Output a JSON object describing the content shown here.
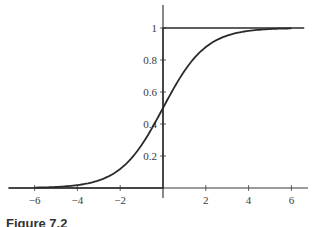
{
  "chart_data": {
    "type": "line",
    "title": "",
    "caption": "Figure 7.2",
    "xlabel": "",
    "ylabel": "",
    "xlim": [
      -7.2,
      6.8
    ],
    "ylim": [
      0,
      1.15
    ],
    "grid": false,
    "legend": null,
    "x_ticks": [
      -6,
      -4,
      -2,
      2,
      4,
      6
    ],
    "x_tick_labels": [
      "−6",
      "−4",
      "−2",
      "2",
      "4",
      "6"
    ],
    "y_ticks": [
      0.2,
      0.4,
      0.6,
      0.8,
      1
    ],
    "y_tick_labels": [
      "0.2",
      "0.4",
      "0.6",
      "0.8",
      "1"
    ],
    "series": [
      {
        "name": "logistic sigmoid",
        "style": "curve",
        "formula": "1/(1+exp(-x))",
        "x": [
          -6,
          -5,
          -4,
          -3,
          -2,
          -1,
          0,
          1,
          2,
          3,
          4,
          5,
          6
        ],
        "y": [
          0.002,
          0.007,
          0.018,
          0.047,
          0.119,
          0.269,
          0.5,
          0.731,
          0.881,
          0.953,
          0.982,
          0.993,
          0.998
        ]
      },
      {
        "name": "unit step",
        "style": "step",
        "x": [
          -7.2,
          0,
          0,
          6.6
        ],
        "y": [
          0,
          0,
          1,
          1
        ]
      }
    ]
  },
  "colors": {
    "line": "#2a2a2a",
    "axis": "#3a3a3a",
    "background": "#ffffff"
  }
}
